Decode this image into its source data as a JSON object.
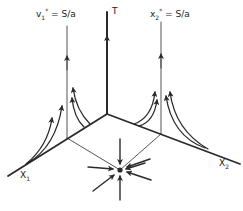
{
  "labels": {
    "t_axis": "T",
    "x1_axis": "X",
    "x1_sub": "1",
    "x2_axis": "X",
    "x2_sub": "2",
    "left_eq_var": "v",
    "left_eq_sub": "1",
    "left_eq_sup": "*",
    "left_eq_rhs": " = S/a",
    "right_eq_var": "x",
    "right_eq_sub": "2",
    "right_eq_sup": "*",
    "right_eq_rhs": " = S/a"
  },
  "colors": {
    "stroke": "#2a2a2a",
    "background": "#ffffff"
  }
}
